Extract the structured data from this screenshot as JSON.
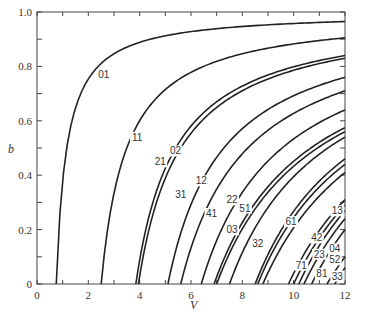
{
  "chart_data": {
    "type": "line",
    "title": "",
    "xlabel": "V",
    "ylabel": "b",
    "xlim": [
      0,
      12
    ],
    "ylim": [
      0,
      1.0
    ],
    "x_ticks": [
      0,
      2,
      4,
      6,
      8,
      10,
      12
    ],
    "x_tick_labels": [
      "0",
      "2",
      "4",
      "6",
      "8",
      "10",
      "12"
    ],
    "y_ticks": [
      0,
      0.2,
      0.4,
      0.6,
      0.8,
      1.0
    ],
    "y_tick_labels": [
      "0",
      "0.2",
      "0.4",
      "0.6",
      "0.8",
      "1.0"
    ],
    "grid": false,
    "legend": "none (curves labeled inline)",
    "series": [
      {
        "name": "01",
        "v_cutoff": 0.75,
        "b_at_12": 0.965,
        "label_at": [
          2.6,
          0.76
        ]
      },
      {
        "name": "11",
        "v_cutoff": 2.5,
        "b_at_12": 0.905,
        "label_at": [
          3.9,
          0.53
        ]
      },
      {
        "name": "21",
        "v_cutoff": 3.85,
        "b_at_12": 0.84,
        "label_at": [
          4.8,
          0.44
        ]
      },
      {
        "name": "02",
        "v_cutoff": 3.95,
        "b_at_12": 0.83,
        "label_at": [
          5.4,
          0.48
        ]
      },
      {
        "name": "31",
        "v_cutoff": 5.1,
        "b_at_12": 0.76,
        "label_at": [
          5.6,
          0.32
        ]
      },
      {
        "name": "12",
        "v_cutoff": 5.6,
        "b_at_12": 0.71,
        "label_at": [
          6.4,
          0.37
        ]
      },
      {
        "name": "41",
        "v_cutoff": 6.4,
        "b_at_12": 0.64,
        "label_at": [
          6.8,
          0.25
        ]
      },
      {
        "name": "22",
        "v_cutoff": 6.9,
        "b_at_12": 0.575,
        "label_at": [
          7.6,
          0.3
        ]
      },
      {
        "name": "03",
        "v_cutoff": 7.0,
        "b_at_12": 0.56,
        "label_at": [
          7.6,
          0.19
        ]
      },
      {
        "name": "51",
        "v_cutoff": 7.5,
        "b_at_12": 0.54,
        "label_at": [
          8.1,
          0.27
        ]
      },
      {
        "name": "32",
        "v_cutoff": 8.5,
        "b_at_12": 0.46,
        "label_at": [
          8.6,
          0.14
        ]
      },
      {
        "name": "61",
        "v_cutoff": 8.6,
        "b_at_12": 0.44,
        "label_at": [
          9.9,
          0.22
        ]
      },
      {
        "name": "13",
        "v_cutoff": 8.8,
        "b_at_12": 0.41,
        "label_at": [
          11.7,
          0.26
        ]
      },
      {
        "name": "42",
        "v_cutoff": 9.8,
        "b_at_12": 0.31,
        "label_at": [
          10.9,
          0.16
        ]
      },
      {
        "name": "71",
        "v_cutoff": 10.0,
        "b_at_12": 0.29,
        "label_at": [
          10.3,
          0.06
        ]
      },
      {
        "name": "23",
        "v_cutoff": 10.2,
        "b_at_12": 0.27,
        "label_at": [
          11.0,
          0.1
        ]
      },
      {
        "name": "04",
        "v_cutoff": 10.4,
        "b_at_12": 0.24,
        "label_at": [
          11.6,
          0.12
        ]
      },
      {
        "name": "52",
        "v_cutoff": 10.7,
        "b_at_12": 0.2,
        "label_at": [
          11.6,
          0.08
        ]
      },
      {
        "name": "81",
        "v_cutoff": 11.3,
        "b_at_12": 0.1,
        "label_at": [
          11.1,
          0.03
        ]
      },
      {
        "name": "33",
        "v_cutoff": 11.6,
        "b_at_12": 0.06,
        "label_at": [
          11.7,
          0.02
        ]
      }
    ]
  }
}
